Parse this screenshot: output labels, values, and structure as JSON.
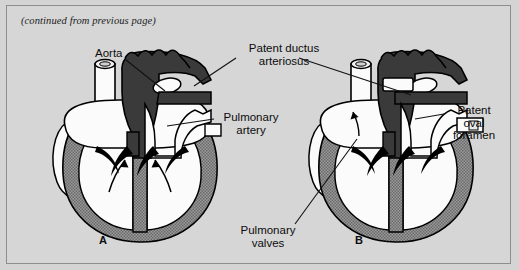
{
  "figure": {
    "continued_note": "(continued from previous page)",
    "background_color": "#d6d6d6",
    "frame_border_color": "#8e8e8e"
  },
  "colors": {
    "deoxygenated_vessel": "#3a3a3a",
    "oxygenated_chamber": "#fbfbfb",
    "myocardium_stipple": "#8c8c8c",
    "outline": "#000000",
    "leader_line": "#111111"
  },
  "labels": [
    {
      "id": "aorta",
      "text": "Aorta",
      "lines": [
        "Aorta"
      ],
      "x": 88,
      "y": 46,
      "align": "left"
    },
    {
      "id": "pda",
      "text": "Patent ductus arteriosus",
      "lines": [
        "Patent ductus",
        "arteriosus"
      ],
      "x": 236,
      "y": 41,
      "align": "center"
    },
    {
      "id": "pulm-artery",
      "text": "Pulmonary artery",
      "lines": [
        "Pulmonary",
        "artery"
      ],
      "x": 212,
      "y": 110,
      "align": "left"
    },
    {
      "id": "pof",
      "text": "Patent oval foramen",
      "lines": [
        "Patent",
        "oval",
        "foramen"
      ],
      "x": 441,
      "y": 104,
      "align": "left"
    },
    {
      "id": "pulm-valves",
      "text": "Pulmonary valves",
      "lines": [
        "Pulmonary",
        "valves"
      ],
      "x": 252,
      "y": 225,
      "align": "center"
    }
  ],
  "panels": [
    {
      "id": "panel-a",
      "letter": "A",
      "x": 96,
      "y": 234,
      "description": "Fetal-type heart with patent ductus arteriosus and open oval foramen"
    },
    {
      "id": "panel-b",
      "letter": "B",
      "x": 352,
      "y": 234,
      "description": "Heart with patent ductus arteriosus, patent oval foramen and pulmonary valves indicated"
    }
  ],
  "anatomy": {
    "deoxygenated_structures": [
      "aortic arch",
      "ductus arteriosus",
      "brachiocephalic branches"
    ],
    "oxygenated_structures": [
      "superior vena cava",
      "pulmonary artery trunk",
      "right atrium",
      "left atrium",
      "right ventricle",
      "left ventricle"
    ],
    "flow_arrows": 4
  }
}
